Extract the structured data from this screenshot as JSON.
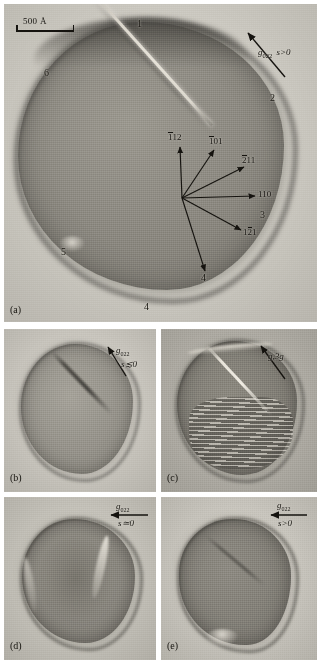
{
  "figure": {
    "scale_bar": {
      "label": "500 Å"
    },
    "panels": [
      {
        "id": "a",
        "caption": "(a)",
        "diffraction_vector": {
          "g": "g",
          "subscript": "022",
          "condition": "s>0",
          "arrow": "up-right"
        },
        "facet_numbers": [
          "1",
          "2",
          "3",
          "4",
          "5",
          "6"
        ],
        "directions": [
          {
            "label": "112",
            "overbar": "1",
            "angle_deg": 92
          },
          {
            "label": "101",
            "overbar": "1",
            "angle_deg": 58
          },
          {
            "label": "211",
            "overbar": "2",
            "angle_deg": 32
          },
          {
            "label": "110",
            "overbar": "",
            "angle_deg": 2
          },
          {
            "label": "121",
            "overbar": "2",
            "angle_deg": -28
          },
          {
            "label": "4",
            "overbar": "",
            "angle_deg": -62
          }
        ]
      },
      {
        "id": "b",
        "caption": "(b)",
        "diffraction_vector": {
          "g": "g",
          "subscript": "022",
          "condition": "s≲0",
          "arrow": "up-right"
        }
      },
      {
        "id": "c",
        "caption": "(c)",
        "diffraction_vector": {
          "g": "g,3g",
          "subscript": "",
          "condition": "",
          "arrow": "up-right"
        }
      },
      {
        "id": "d",
        "caption": "(d)",
        "diffraction_vector": {
          "g": "g",
          "subscript": "022",
          "condition": "s≃0",
          "arrow": "left"
        }
      },
      {
        "id": "e",
        "caption": "(e)",
        "diffraction_vector": {
          "g": "g",
          "subscript": "022",
          "condition": "s>0",
          "arrow": "left"
        }
      }
    ]
  }
}
